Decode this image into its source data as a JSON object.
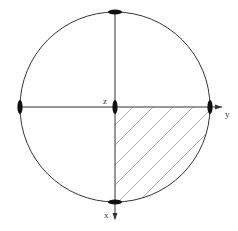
{
  "diagram": {
    "type": "circle-section",
    "axes": {
      "z": {
        "label": "z"
      },
      "y": {
        "label": "y"
      },
      "x": {
        "label": "x"
      }
    },
    "shaded_region": "quadrant between +y and +x axes",
    "colors": {
      "stroke": "#333333",
      "hatch": "#9a9a9a",
      "background": "#ffffff"
    }
  }
}
